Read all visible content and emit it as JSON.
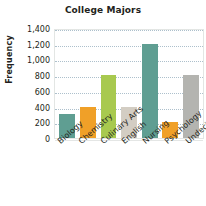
{
  "chart_data": {
    "type": "bar",
    "title": "College Majors",
    "xlabel": "",
    "ylabel": "Frequency",
    "categories": [
      "Biology",
      "Chemistry",
      "Culinary Arts",
      "English",
      "Nursing",
      "Psychology",
      "Undecided"
    ],
    "values": [
      300,
      400,
      800,
      400,
      1200,
      200,
      800
    ],
    "bar_colors": [
      "#5f9e92",
      "#f0a028",
      "#a8c94f",
      "#d3cdc3",
      "#5f9e92",
      "#f0a028",
      "#b4b4b0"
    ],
    "ylim": [
      0,
      1400
    ],
    "ytick_values": [
      0,
      200,
      400,
      600,
      800,
      1000,
      1200,
      1400
    ],
    "ytick_labels": [
      "0",
      "200",
      "400",
      "600",
      "800",
      "1,000",
      "1,200",
      "1,400"
    ],
    "grid": true,
    "grid_style": "dotted-horizontal",
    "legend": "none",
    "xtick_rotation": -41
  },
  "style": {
    "text_color": "#231f20",
    "grid_color": "#9fb6c4",
    "frame_color": "#e3e6e4",
    "background": "#ffffff"
  }
}
